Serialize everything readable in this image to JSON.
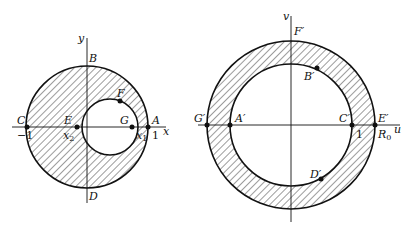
{
  "left_diagram": {
    "axes": {
      "x": "x",
      "y": "y"
    },
    "points": {
      "A": "A",
      "B": "B",
      "C": "C",
      "D": "D",
      "E": "E",
      "F": "F",
      "G": "G"
    },
    "ticks": {
      "minus_one": "−1",
      "one": "1",
      "x1": "x",
      "x1_sub": "1",
      "x2": "x",
      "x2_sub": "2"
    },
    "description": "Shaded region between unit circle and inner offset circle in z-plane"
  },
  "right_diagram": {
    "axes": {
      "u": "u",
      "v": "v"
    },
    "points": {
      "A": "A′",
      "B": "B′",
      "C": "C′",
      "D": "D′",
      "E": "E′",
      "F": "F′",
      "G": "G′"
    },
    "ticks": {
      "one": "1",
      "R0": "R",
      "R0_sub": "0"
    },
    "description": "Shaded concentric annulus between radius 1 and R0 in w-plane"
  }
}
